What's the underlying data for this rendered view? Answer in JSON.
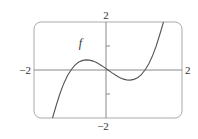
{
  "chart_data": {
    "type": "line",
    "title": "",
    "xlabel": "",
    "ylabel": "",
    "xlim": [
      -2,
      2
    ],
    "ylim": [
      -2,
      2
    ],
    "grid": false,
    "axis_labels": {
      "x_min": "−2",
      "x_max": "2",
      "y_min": "−2",
      "y_max": "2"
    },
    "y_ticks": [
      -1,
      1
    ],
    "series": [
      {
        "name": "f",
        "label": "f",
        "x": [
          -1.5,
          -1.4,
          -1.3,
          -1.2,
          -1.1,
          -1.0,
          -0.9,
          -0.8,
          -0.7,
          -0.6,
          -0.5,
          -0.4,
          -0.3,
          -0.2,
          -0.1,
          0.0,
          0.1,
          0.2,
          0.3,
          0.4,
          0.5,
          0.6,
          0.7,
          0.8,
          0.9,
          1.0,
          1.1,
          1.2,
          1.3,
          1.4,
          1.5
        ],
        "y": [
          -2.06,
          -1.48,
          -0.99,
          -0.58,
          -0.25,
          0.0,
          0.19,
          0.32,
          0.39,
          0.42,
          0.41,
          0.37,
          0.3,
          0.21,
          0.11,
          0.0,
          -0.11,
          -0.21,
          -0.3,
          -0.37,
          -0.41,
          -0.42,
          -0.39,
          -0.32,
          -0.19,
          0.0,
          0.25,
          0.58,
          0.99,
          1.48,
          2.06
        ]
      }
    ],
    "legend": "none",
    "annotations": [
      {
        "text": "f",
        "x": -0.75,
        "y": 0.95
      }
    ]
  },
  "colors": {
    "curve": "#555555",
    "axes": "#888888",
    "frame": "#aaaaaa"
  }
}
